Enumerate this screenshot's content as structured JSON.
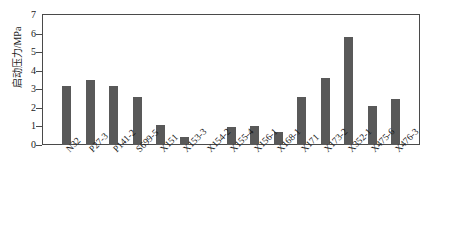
{
  "chart_data": {
    "type": "bar",
    "title": "",
    "xlabel": "",
    "ylabel": "启动压力/MPa",
    "ylim": [
      0,
      7
    ],
    "yticks": [
      0,
      1,
      2,
      3,
      4,
      5,
      6,
      7
    ],
    "grid": false,
    "legend": null,
    "bar_color": "#595959",
    "axis_color": "#4a4a4a",
    "categories": [
      "N32",
      "P27-3",
      "P141-2",
      "S699-5",
      "X151",
      "X153-3",
      "X154-2",
      "X155-4",
      "X156-1",
      "X168-1",
      "X171",
      "X173-2",
      "X352-1",
      "X475-6",
      "X476-3"
    ],
    "values": [
      3.2,
      3.5,
      3.2,
      2.6,
      1.1,
      0.45,
      0.0,
      0.95,
      1.05,
      0.7,
      2.6,
      3.6,
      5.8,
      2.1,
      2.5
    ]
  }
}
